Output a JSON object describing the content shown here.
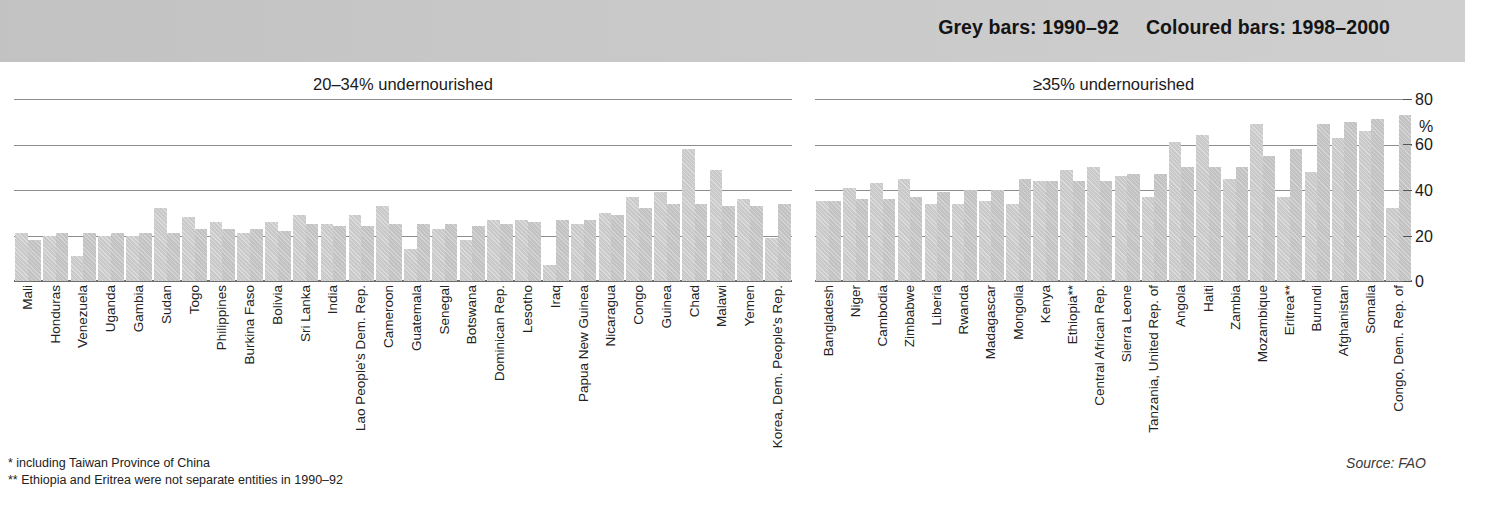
{
  "header": {
    "legend_grey": "Grey bars: 1990–92",
    "legend_coloured": "Coloured bars: 1998–2000"
  },
  "panels": {
    "left_title": "20–34% undernourished",
    "right_title": "≥35% undernourished"
  },
  "yaxis": {
    "ticks": [
      "80",
      "60",
      "40",
      "20",
      "0"
    ],
    "unit": "%"
  },
  "footnotes": {
    "one": "* including Taiwan Province of China",
    "two": "** Ethiopia and Eritrea were not separate entities in 1990–92"
  },
  "source": "Source: FAO",
  "chart_data": {
    "type": "bar",
    "xlabel": "",
    "ylabel": "%",
    "ylim": [
      0,
      80
    ],
    "yticks": [
      0,
      20,
      40,
      60,
      80
    ],
    "grid": true,
    "legend_position": "top-right",
    "series_names": [
      "1990–92",
      "1998–2000"
    ],
    "series_colors": [
      "#c9c9c9",
      "#c2c2c2"
    ],
    "panels": [
      {
        "name": "20–34% undernourished",
        "categories": [
          "Mali",
          "Honduras",
          "Venezuela",
          "Uganda",
          "Gambia",
          "Sudan",
          "Togo",
          "Philippines",
          "Burkina Faso",
          "Bolivia",
          "Sri Lanka",
          "India",
          "Lao People's Dem. Rep.",
          "Cameroon",
          "Guatemala",
          "Senegal",
          "Botswana",
          "Dominican Rep.",
          "Lesotho",
          "Iraq",
          "Papua New Guinea",
          "Nicaragua",
          "Congo",
          "Guinea",
          "Chad",
          "Malawi",
          "Yemen",
          "Korea, Dem. People's Rep."
        ],
        "series": [
          {
            "name": "1990–92",
            "values": [
              21,
              20,
              11,
              20,
              20,
              32,
              28,
              26,
              21,
              26,
              29,
              25,
              29,
              33,
              14,
              23,
              18,
              27,
              27,
              7,
              25,
              30,
              37,
              39,
              58,
              49,
              36,
              19
            ]
          },
          {
            "name": "1998–2000",
            "values": [
              18,
              21,
              21,
              21,
              21,
              21,
              23,
              23,
              23,
              22,
              25,
              24,
              24,
              25,
              25,
              25,
              24,
              25,
              26,
              27,
              27,
              29,
              32,
              34,
              34,
              33,
              33,
              34
            ]
          }
        ]
      },
      {
        "name": "≥35% undernourished",
        "categories": [
          "Bangladesh",
          "Niger",
          "Cambodia",
          "Zimbabwe",
          "Liberia",
          "Rwanda",
          "Madagascar",
          "Mongolia",
          "Kenya",
          "Ethiopia**",
          "Central African Rep.",
          "Sierra Leone",
          "Tanzania, United Rep. of",
          "Angola",
          "Haiti",
          "Zambia",
          "Mozambique",
          "Eritrea**",
          "Burundi",
          "Afghanistan",
          "Somalia",
          "Congo, Dem. Rep. of"
        ],
        "series": [
          {
            "name": "1990–92",
            "values": [
              35,
              41,
              43,
              45,
              34,
              34,
              35,
              34,
              44,
              49,
              50,
              46,
              37,
              61,
              64,
              45,
              69,
              37,
              48,
              63,
              66,
              32
            ]
          },
          {
            "name": "1998–2000",
            "values": [
              35,
              36,
              36,
              37,
              39,
              40,
              40,
              45,
              44,
              44,
              44,
              47,
              47,
              50,
              50,
              50,
              55,
              58,
              69,
              70,
              71,
              73
            ]
          }
        ]
      }
    ]
  }
}
